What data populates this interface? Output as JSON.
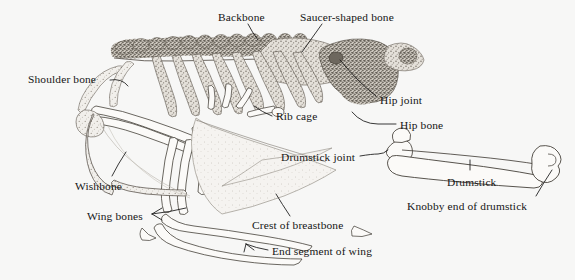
{
  "figure": {
    "style": "stippled pen-and-ink engraving",
    "background_color": "#f7f7f6",
    "ink_color": "#151515",
    "bone_fill_light": "#efefec",
    "bone_fill_mid": "#b9b5ad",
    "bone_fill_dark": "#8d887e"
  },
  "labels": [
    {
      "id": "backbone",
      "text": "Backbone",
      "x": 218,
      "y": 12
    },
    {
      "id": "saucer-shaped-bone",
      "text": "Saucer-shaped bone",
      "x": 300,
      "y": 12
    },
    {
      "id": "shoulder-bone",
      "text": "Shoulder bone",
      "x": 28,
      "y": 74
    },
    {
      "id": "hip-joint",
      "text": "Hip joint",
      "x": 380,
      "y": 95
    },
    {
      "id": "rib-cage",
      "text": "Rib cage",
      "x": 276,
      "y": 111
    },
    {
      "id": "hip-bone",
      "text": "Hip bone",
      "x": 400,
      "y": 120
    },
    {
      "id": "drumstick-joint",
      "text": "Drumstick joint",
      "x": 281,
      "y": 152
    },
    {
      "id": "drumstick",
      "text": "Drumstick",
      "x": 447,
      "y": 177
    },
    {
      "id": "wishbone",
      "text": "Wishbone",
      "x": 75,
      "y": 181
    },
    {
      "id": "knobby-end",
      "text": "Knobby end of drumstick",
      "x": 407,
      "y": 201
    },
    {
      "id": "wing-bones",
      "text": "Wing bones",
      "x": 87,
      "y": 211
    },
    {
      "id": "crest-of-breastbone",
      "text": "Crest of breastbone",
      "x": 252,
      "y": 220
    },
    {
      "id": "end-segment-of-wing",
      "text": "End segment of wing",
      "x": 272,
      "y": 246
    }
  ],
  "anatomy_parts": [
    "backbone (vertebral column)",
    "saucer-shaped bone",
    "shoulder bone",
    "rib cage",
    "hip bone",
    "hip joint",
    "wishbone",
    "wing bones",
    "end segment of wing",
    "crest of breastbone",
    "drumstick joint",
    "drumstick",
    "knobby end of drumstick"
  ]
}
